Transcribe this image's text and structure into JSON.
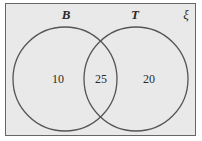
{
  "diagram": {
    "type": "venn",
    "universe_label": "ξ",
    "sets": [
      {
        "id": "B",
        "label": "B"
      },
      {
        "id": "T",
        "label": "T"
      }
    ],
    "regions": {
      "only_B": "10",
      "B_and_T": "25",
      "only_T": "20"
    },
    "colors": {
      "background": "#e9e9e9",
      "stroke": "#555555",
      "text": "#2a2a2a"
    }
  }
}
